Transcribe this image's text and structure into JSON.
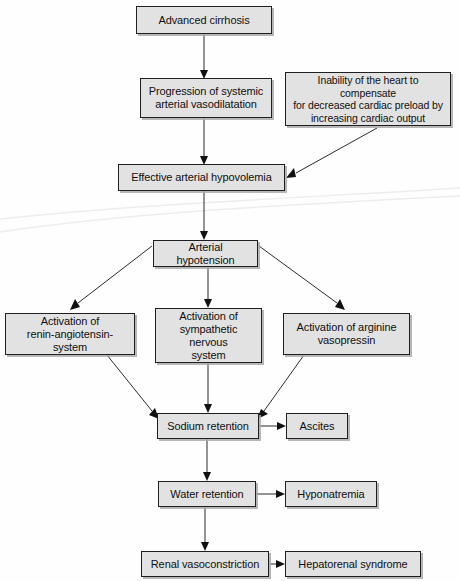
{
  "diagram": {
    "type": "flowchart",
    "orientation": "top-to-bottom",
    "nodes": [
      {
        "id": "advanced-cirrhosis",
        "label": "Advanced cirrhosis",
        "x": 136,
        "y": 6,
        "w": 136,
        "h": 28
      },
      {
        "id": "progression-vasodilatation",
        "label": "Progression of systemic\narterial vasodilatation",
        "x": 140,
        "y": 78,
        "w": 132,
        "h": 40
      },
      {
        "id": "inability-heart",
        "label": "Inability of the heart to compensate\nfor decreased cardiac preload by\nincreasing cardiac output",
        "x": 285,
        "y": 72,
        "w": 166,
        "h": 54
      },
      {
        "id": "effective-hypovolemia",
        "label": "Effective arterial hypovolemia",
        "x": 118,
        "y": 164,
        "w": 167,
        "h": 27
      },
      {
        "id": "arterial-hypotension",
        "label": "Arterial hypotension",
        "x": 153,
        "y": 240,
        "w": 105,
        "h": 27
      },
      {
        "id": "activation-renin",
        "label": "Activation of\nrenin-angiotensin-system",
        "x": 5,
        "y": 313,
        "w": 130,
        "h": 42
      },
      {
        "id": "activation-sympathetic",
        "label": "Activation of\nsympathetic nervous\nsystem",
        "x": 155,
        "y": 308,
        "w": 107,
        "h": 55
      },
      {
        "id": "activation-arginine",
        "label": "Activation of arginine\nvasopressin",
        "x": 283,
        "y": 313,
        "w": 127,
        "h": 42
      },
      {
        "id": "sodium-retention",
        "label": "Sodium retention",
        "x": 157,
        "y": 413,
        "w": 102,
        "h": 26
      },
      {
        "id": "ascites",
        "label": "Ascites",
        "x": 286,
        "y": 413,
        "w": 62,
        "h": 26
      },
      {
        "id": "water-retention",
        "label": "Water retention",
        "x": 158,
        "y": 481,
        "w": 98,
        "h": 26
      },
      {
        "id": "hyponatremia",
        "label": "Hyponatremia",
        "x": 285,
        "y": 481,
        "w": 92,
        "h": 26
      },
      {
        "id": "renal-vasoconstriction",
        "label": "Renal vasoconstriction",
        "x": 141,
        "y": 551,
        "w": 128,
        "h": 26
      },
      {
        "id": "hepatorenal-syndrome",
        "label": "Hepatorenal syndrome",
        "x": 285,
        "y": 551,
        "w": 136,
        "h": 26
      }
    ],
    "edges": [
      {
        "id": "e-cirrhosis-to-progression",
        "from": "advanced-cirrhosis",
        "to": "progression-vasodilatation",
        "kind": "vertical"
      },
      {
        "id": "e-progression-to-hypovolemia",
        "from": "progression-vasodilatation",
        "to": "effective-hypovolemia",
        "kind": "vertical"
      },
      {
        "id": "e-inability-to-hypovolemia",
        "from": "inability-heart",
        "to": "effective-hypovolemia",
        "kind": "diagonal"
      },
      {
        "id": "e-hypovolemia-to-hypotension",
        "from": "effective-hypovolemia",
        "to": "arterial-hypotension",
        "kind": "vertical"
      },
      {
        "id": "e-hypotension-to-renin",
        "from": "arterial-hypotension",
        "to": "activation-renin",
        "kind": "diagonal"
      },
      {
        "id": "e-hypotension-to-sympathetic",
        "from": "arterial-hypotension",
        "to": "activation-sympathetic",
        "kind": "vertical"
      },
      {
        "id": "e-hypotension-to-arginine",
        "from": "arterial-hypotension",
        "to": "activation-arginine",
        "kind": "diagonal"
      },
      {
        "id": "e-renin-to-sodium",
        "from": "activation-renin",
        "to": "sodium-retention",
        "kind": "diagonal"
      },
      {
        "id": "e-sympathetic-to-sodium",
        "from": "activation-sympathetic",
        "to": "sodium-retention",
        "kind": "vertical"
      },
      {
        "id": "e-arginine-to-sodium",
        "from": "activation-arginine",
        "to": "sodium-retention",
        "kind": "diagonal"
      },
      {
        "id": "e-sodium-to-ascites",
        "from": "sodium-retention",
        "to": "ascites",
        "kind": "horizontal"
      },
      {
        "id": "e-sodium-to-water",
        "from": "sodium-retention",
        "to": "water-retention",
        "kind": "vertical"
      },
      {
        "id": "e-water-to-hyponatremia",
        "from": "water-retention",
        "to": "hyponatremia",
        "kind": "horizontal"
      },
      {
        "id": "e-water-to-renal",
        "from": "water-retention",
        "to": "renal-vasoconstriction",
        "kind": "vertical"
      },
      {
        "id": "e-renal-to-hepatorenal",
        "from": "renal-vasoconstriction",
        "to": "hepatorenal-syndrome",
        "kind": "horizontal"
      }
    ],
    "style": {
      "box_fill": "#e2e2e2",
      "box_border": "#1f1f1f",
      "box_shadow": "#aaaaaa",
      "arrow_color": "#2b2b2b",
      "text_color": "#101010",
      "background": "#fefefe"
    }
  }
}
